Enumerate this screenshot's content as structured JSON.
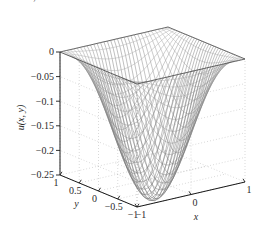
{
  "page": {
    "background_color": "#ffffff",
    "width": 266,
    "height": 250,
    "cut_off_header_text": "▬▬ ▬, ▬▬▬▬ ▬▬▬ ▬▬▬ ▬▬▬▬▬▬ ▬▬▬▬▬▬, ▬▬ ▬▬ ▬▬ ▬▬▬▬▬"
  },
  "chart_data": {
    "type": "surface",
    "title": "",
    "xlabel": "x",
    "ylabel": "y",
    "zlabel": "u(x, y)",
    "xlim": [
      -1,
      1
    ],
    "ylim": [
      -1,
      1
    ],
    "zlim": [
      -0.25,
      0
    ],
    "xticks": [
      -1,
      0,
      1
    ],
    "xticklabels": [
      "−1",
      "0",
      "1"
    ],
    "yticks": [
      -1,
      -0.5,
      0,
      0.5,
      1
    ],
    "yticklabels": [
      "−1",
      "−0.5",
      "0",
      "0.5",
      "1"
    ],
    "zticks": [
      -0.25,
      -0.2,
      -0.15,
      -0.1,
      -0.05,
      0
    ],
    "zticklabels": [
      "−0.25",
      "−0.2",
      "−0.15",
      "−0.1",
      "−0.05",
      "0"
    ],
    "grid": true,
    "grid_style": "dotted",
    "grid_color": "#b9b9b9",
    "mesh_color": "#4a4a4a",
    "axis_color": "#1a1a1a",
    "legend": "none",
    "surface_description": "Bowl-shaped paraboloid solution u(x,y) of a Poisson problem on the unit square, zero on the boundary, minimum about -0.25 at the centre.",
    "nx": 33,
    "ny": 33,
    "z_min": -0.2947,
    "z_max": 0.0,
    "z_center": -0.2947,
    "z_at_corner": 0.0,
    "view_azimuth": -37.5,
    "view_elevation": 30,
    "sample_points": [
      {
        "x": -1,
        "y": -1,
        "z": 0
      },
      {
        "x": -1,
        "y": 0,
        "z": 0
      },
      {
        "x": -1,
        "y": 1,
        "z": 0
      },
      {
        "x": 0,
        "y": -1,
        "z": 0
      },
      {
        "x": 0,
        "y": -0.5,
        "z": -0.1693
      },
      {
        "x": 0,
        "y": 0,
        "z": -0.2947
      },
      {
        "x": 0,
        "y": 0.5,
        "z": -0.1693
      },
      {
        "x": 0,
        "y": 1,
        "z": 0
      },
      {
        "x": 1,
        "y": -1,
        "z": 0
      },
      {
        "x": 1,
        "y": 0,
        "z": 0
      },
      {
        "x": 1,
        "y": 1,
        "z": 0
      },
      {
        "x": -0.5,
        "y": 0,
        "z": -0.1693
      },
      {
        "x": 0.5,
        "y": 0,
        "z": -0.1693
      },
      {
        "x": -0.5,
        "y": -0.5,
        "z": -0.0995
      },
      {
        "x": 0.5,
        "y": 0.5,
        "z": -0.0995
      }
    ]
  }
}
